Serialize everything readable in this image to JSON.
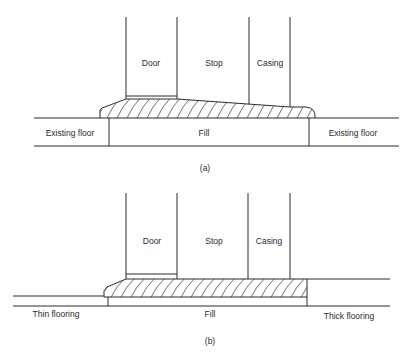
{
  "figure_a": {
    "caption": "(a)",
    "labels": {
      "door": "Door",
      "stop": "Stop",
      "casing": "Casing",
      "left_floor": "Existing floor",
      "fill": "Fill",
      "right_floor": "Existing floor"
    }
  },
  "figure_b": {
    "caption": "(b)",
    "labels": {
      "door": "Door",
      "stop": "Stop",
      "casing": "Casing",
      "left_floor": "Thin flooring",
      "fill": "Fill",
      "right_floor": "Thick flooring"
    }
  },
  "colors": {
    "line": "#2a2a2a",
    "background": "#ffffff"
  }
}
